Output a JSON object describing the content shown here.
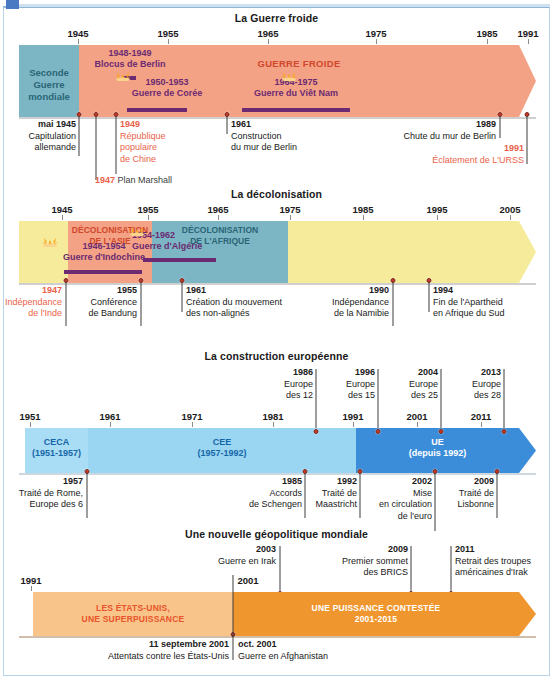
{
  "colors": {
    "salmon": "#f4a285",
    "salmon_light": "#f7b79d",
    "teal": "#7cb6c4",
    "yellow": "#f6eb9b",
    "blue_light": "#a9dcf5",
    "blue_mid": "#9ad5f2",
    "blue_dark": "#3c8dd9",
    "orange_light": "#f9c48a",
    "orange": "#f0962f",
    "purple": "#6b2a72",
    "red_text": "#e8634a",
    "dot": "#c0392b"
  },
  "timelines": [
    {
      "id": "guerre-froide",
      "title": "La Guerre froide",
      "axis": {
        "ticks": [
          {
            "year": 1945,
            "label": "1945"
          },
          {
            "year": 1955,
            "label": "1955"
          },
          {
            "year": 1965,
            "label": "1965"
          },
          {
            "year": 1975,
            "label": "1975"
          },
          {
            "year": 1985,
            "label": "1985"
          },
          {
            "year": 1991,
            "label": "1991"
          }
        ]
      },
      "segments": [
        {
          "label": "Seconde\nGuerre\nmondiale",
          "color": "#7cb6c4",
          "text_color": "#2b6576"
        },
        {
          "label": "GUERRE FROIDE",
          "color": "#f4a285",
          "text_color": "#d1472b"
        }
      ],
      "wars": [
        {
          "years": "1948-1949",
          "name": "Blocus de Berlin"
        },
        {
          "years": "1950-1953",
          "name": "Guerre de Corée"
        },
        {
          "years": "1964-1975",
          "name": "Guerre du Viêt Nam"
        }
      ],
      "events": [
        {
          "year": "mai 1945",
          "text": "Capitulation\nallemande",
          "red": false
        },
        {
          "year": "1947",
          "text": "Plan Marshall",
          "red": true,
          "inline": true
        },
        {
          "year": "1949",
          "text": "République\npopulaire\nde Chine",
          "red": true
        },
        {
          "year": "1961",
          "text": "Construction\ndu mur de Berlin",
          "red": false
        },
        {
          "year": "1989",
          "text": "Chute du mur de Berlin",
          "red": false
        },
        {
          "year": "1991",
          "text": "Éclatement de L'URSS",
          "red": true
        }
      ]
    },
    {
      "id": "decolonisation",
      "title": "La décolonisation",
      "axis": {
        "ticks": [
          {
            "year": 1945,
            "label": "1945"
          },
          {
            "year": 1955,
            "label": "1955"
          },
          {
            "year": 1965,
            "label": "1965"
          },
          {
            "year": 1975,
            "label": "1975"
          },
          {
            "year": 1985,
            "label": "1985"
          },
          {
            "year": 1995,
            "label": "1995"
          },
          {
            "year": 2005,
            "label": "2005"
          }
        ]
      },
      "segments": [
        {
          "label": "",
          "color": "#f6eb9b",
          "text_color": "#1a1a1a"
        },
        {
          "label": "DÉCOLONISATION\nDE L'ASIE",
          "color": "#f4a285",
          "text_color": "#d1472b"
        },
        {
          "label": "DÉCOLONISATION\nDE L'AFRIQUE",
          "color": "#7cb6c4",
          "text_color": "#2b6576"
        }
      ],
      "wars": [
        {
          "years": "1946-1954",
          "name": "Guerre d'Indochine"
        },
        {
          "years": "1954-1962",
          "name": "Guerre d'Algérie"
        }
      ],
      "events": [
        {
          "year": "1947",
          "text": "Indépendance\nde l'Inde",
          "red": true
        },
        {
          "year": "1955",
          "text": "Conférence\nde Bandung",
          "red": false
        },
        {
          "year": "1961",
          "text": "Création du mouvement\ndes non-alignés",
          "red": false
        },
        {
          "year": "1990",
          "text": "Indépendance\nde la Namibie",
          "red": false
        },
        {
          "year": "1994",
          "text": "Fin de l'Apartheid\nen Afrique du Sud",
          "red": false
        }
      ]
    },
    {
      "id": "construction-europeenne",
      "title": "La construction européenne",
      "axis": {
        "ticks": [
          {
            "year": 1951,
            "label": "1951"
          },
          {
            "year": 1961,
            "label": "1961"
          },
          {
            "year": 1971,
            "label": "1971"
          },
          {
            "year": 1981,
            "label": "1981"
          },
          {
            "year": 1991,
            "label": "1991"
          },
          {
            "year": 2001,
            "label": "2001"
          },
          {
            "year": 2011,
            "label": "2011"
          }
        ]
      },
      "segments": [
        {
          "label": "CECA\n(1951-1957)",
          "color": "#a9dcf5",
          "text_color": "#1667a8"
        },
        {
          "label": "CEE\n(1957-1992)",
          "color": "#9ad5f2",
          "text_color": "#1667a8"
        },
        {
          "label": "UE\n(depuis 1992)",
          "color": "#3c8dd9",
          "text_color": "#ffffff"
        }
      ],
      "events_above": [
        {
          "year": "1986",
          "text": "Europe\ndes 12"
        },
        {
          "year": "1996",
          "text": "Europe\ndes 15"
        },
        {
          "year": "2004",
          "text": "Europe\ndes 25"
        },
        {
          "year": "2013",
          "text": "Europe\ndes 28"
        }
      ],
      "events_below": [
        {
          "year": "1957",
          "text": "Traité de Rome,\nEurope des 6"
        },
        {
          "year": "1985",
          "text": "Accords\nde Schengen"
        },
        {
          "year": "1992",
          "text": "Traité de\nMaastricht"
        },
        {
          "year": "2002",
          "text": "Mise\nen circulation\nde l'euro"
        },
        {
          "year": "2009",
          "text": "Traité de\nLisbonne"
        }
      ]
    },
    {
      "id": "geopolitique-mondiale",
      "title": "Une nouvelle géopolitique mondiale",
      "axis": {
        "ticks": [
          {
            "year": 1991,
            "label": "1991"
          },
          {
            "year": 2001,
            "label": "2001"
          }
        ]
      },
      "segments": [
        {
          "label": "LES ÉTATS-UNIS,\nUNE SUPERPUISSANCE",
          "color": "#f9c48a",
          "text_color": "#e8542b"
        },
        {
          "label": "UNE PUISSANCE CONTESTÉE\n2001-2015",
          "color": "#f0962f",
          "text_color": "#ffffff"
        }
      ],
      "events_above": [
        {
          "year": "2003",
          "text": "Guerre en Irak"
        },
        {
          "year": "2009",
          "text": "Premier sommet\ndes BRICS"
        },
        {
          "year": "2011",
          "text": "Retrait des troupes\naméricaines d'Irak"
        }
      ],
      "events_below": [
        {
          "year": "11 septembre 2001",
          "text": "Attentats contre les États-Unis"
        },
        {
          "year": "oct. 2001",
          "text": "Guerre en Afghanistan"
        }
      ]
    }
  ]
}
